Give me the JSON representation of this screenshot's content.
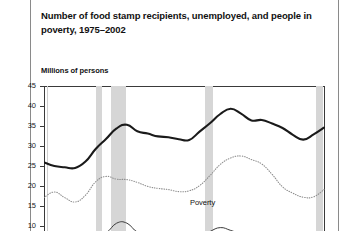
{
  "figure": {
    "title": "Number of food stamp recipients, unemployed, and people in poverty, 1975–2002",
    "axis_unit_label": "Millions of persons"
  },
  "chart_data": {
    "type": "line",
    "title": "Number of food stamp recipients, unemployed, and people in poverty, 1975–2002",
    "xlabel": "",
    "ylabel": "Millions of persons",
    "ylim": [
      8,
      45
    ],
    "xlim": [
      1975,
      2002
    ],
    "grid": false,
    "legend_position": "inline-annotations",
    "ytick_labels": [
      "45",
      "40",
      "35",
      "30",
      "25",
      "20",
      "15",
      "10"
    ],
    "ytick_values": [
      45,
      40,
      35,
      30,
      25,
      20,
      15,
      10
    ],
    "x": [
      1975,
      1976,
      1977,
      1978,
      1979,
      1980,
      1981,
      1982,
      1983,
      1984,
      1985,
      1986,
      1987,
      1988,
      1989,
      1990,
      1991,
      1992,
      1993,
      1994,
      1995,
      1996,
      1997,
      1998,
      1999,
      2000,
      2001,
      2002
    ],
    "series": [
      {
        "name": "Poverty",
        "style": "thick-solid",
        "color": "#1a1a1a",
        "label": "Poverty",
        "values": [
          25.9,
          25.0,
          24.7,
          24.5,
          26.1,
          29.3,
          31.8,
          34.4,
          35.3,
          33.7,
          33.1,
          32.4,
          32.2,
          31.7,
          31.5,
          33.6,
          35.7,
          38.0,
          39.3,
          38.1,
          36.4,
          36.5,
          35.6,
          34.5,
          32.8,
          31.6,
          32.9,
          34.6
        ]
      },
      {
        "name": "Food stamps recipients",
        "style": "dotted",
        "color": "#8f8f8f",
        "label": "Food stamps recipients",
        "values": [
          17.1,
          18.5,
          17.1,
          16.0,
          17.7,
          21.1,
          22.4,
          21.7,
          21.6,
          20.9,
          19.9,
          19.4,
          19.1,
          18.6,
          18.8,
          20.1,
          22.6,
          25.4,
          27.0,
          27.5,
          26.6,
          25.5,
          22.9,
          19.8,
          18.2,
          17.2,
          17.3,
          19.1
        ]
      },
      {
        "name": "Unemployed",
        "style": "thin-solid",
        "color": "#3a3a3a",
        "label": "Unemployed",
        "values": [
          7.9,
          7.4,
          7.0,
          6.2,
          6.1,
          7.6,
          8.3,
          10.7,
          10.7,
          8.5,
          8.3,
          8.2,
          7.4,
          6.7,
          6.5,
          7.0,
          8.6,
          9.6,
          8.9,
          8.0,
          7.4,
          7.2,
          6.7,
          6.2,
          5.9,
          5.7,
          6.8,
          8.4
        ]
      }
    ],
    "recession_bands": [
      {
        "start": 1980.0,
        "end": 1980.6
      },
      {
        "start": 1981.5,
        "end": 1982.9
      },
      {
        "start": 1990.5,
        "end": 1991.3
      },
      {
        "start": 2001.2,
        "end": 2001.9
      }
    ]
  }
}
